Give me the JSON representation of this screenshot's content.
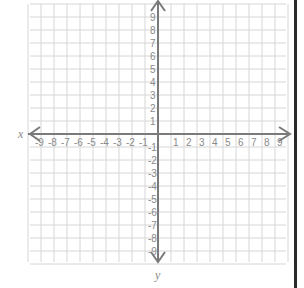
{
  "diagram": {
    "type": "coordinate-plane",
    "x_axis_label": "x",
    "y_axis_label": "y",
    "x_range": [
      -9,
      9
    ],
    "y_range": [
      -9,
      9
    ],
    "x_tick_labels": [
      "-9",
      "-8",
      "-7",
      "-6",
      "-5",
      "-4",
      "-3",
      "-2",
      "-1",
      "1",
      "2",
      "3",
      "4",
      "5",
      "6",
      "7",
      "8",
      "9"
    ],
    "y_tick_labels": [
      "9",
      "8",
      "7",
      "6",
      "5",
      "4",
      "3",
      "2",
      "1",
      "-1",
      "-2",
      "-3",
      "-4",
      "-5",
      "-6",
      "-7",
      "-8",
      "-9"
    ],
    "grid": true,
    "arrows": [
      "left",
      "right",
      "up",
      "down"
    ]
  },
  "colors": {
    "grid": "#d6d6d6",
    "axis": "#7a7a7a",
    "label": "#8a8a8a",
    "border": "#2a2a2a"
  }
}
